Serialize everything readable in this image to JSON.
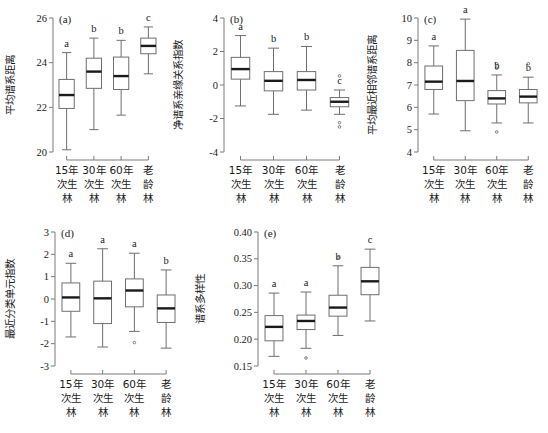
{
  "figure": {
    "title": "",
    "background": "#ffffff",
    "axis_color": "#7a7a7a",
    "box_color": "#6f6f6f",
    "median_color": "#1a1a1a",
    "text_color": "#1a1a1a"
  },
  "categories_label": [
    "15年次生林",
    "30年次生林",
    "60年次生林",
    "老龄林"
  ],
  "category_lines": [
    [
      "15年",
      "次生",
      "林"
    ],
    [
      "30年",
      "次生",
      "林"
    ],
    [
      "60年",
      "次生",
      "林"
    ],
    [
      "老",
      "龄",
      "林"
    ]
  ],
  "chart_data": [
    {
      "type": "box",
      "panel": "(a)",
      "title": "",
      "xlabel": "",
      "ylabel": "平均谱系距离",
      "ylim": [
        20,
        26
      ],
      "yticks": [
        20,
        22,
        24,
        26
      ],
      "ytick_labels": [
        "20",
        "22",
        "24",
        "26"
      ],
      "grid": false,
      "legend": "none",
      "categories": [
        "15年次生林",
        "30年次生林",
        "60年次生林",
        "老龄林"
      ],
      "sig_letters": [
        "a",
        "b",
        "b",
        "c"
      ],
      "boxes": [
        {
          "category": "15年次生林",
          "whisker_low": 20.1,
          "q1": 21.95,
          "median": 22.55,
          "q3": 23.25,
          "whisker_high": 24.45,
          "outliers": []
        },
        {
          "category": "30年次生林",
          "whisker_low": 21.0,
          "q1": 22.85,
          "median": 23.6,
          "q3": 24.2,
          "whisker_high": 25.1,
          "outliers": []
        },
        {
          "category": "60年次生林",
          "whisker_low": 21.65,
          "q1": 22.8,
          "median": 23.4,
          "q3": 24.25,
          "whisker_high": 25.0,
          "outliers": []
        },
        {
          "category": "老龄林",
          "whisker_low": 23.5,
          "q1": 24.4,
          "median": 24.75,
          "q3": 25.1,
          "whisker_high": 25.6,
          "outliers": []
        }
      ]
    },
    {
      "type": "box",
      "panel": "(b)",
      "title": "",
      "xlabel": "",
      "ylabel": "净谱系亲缘关系指数",
      "ylim": [
        -4,
        4
      ],
      "yticks": [
        -4,
        -2,
        0,
        2,
        4
      ],
      "ytick_labels": [
        "-4",
        "-2",
        "0",
        "2",
        "4"
      ],
      "grid": false,
      "legend": "none",
      "categories": [
        "15年次生林",
        "30年次生林",
        "60年次生林",
        "老龄林"
      ],
      "sig_letters": [
        "a",
        "b",
        "b",
        "c"
      ],
      "boxes": [
        {
          "category": "15年次生林",
          "whisker_low": -1.25,
          "q1": 0.35,
          "median": 0.95,
          "q3": 1.65,
          "whisker_high": 2.95,
          "outliers": []
        },
        {
          "category": "30年次生林",
          "whisker_low": -1.75,
          "q1": -0.35,
          "median": 0.25,
          "q3": 0.8,
          "whisker_high": 2.2,
          "outliers": []
        },
        {
          "category": "60年次生林",
          "whisker_low": -1.5,
          "q1": -0.3,
          "median": 0.3,
          "q3": 0.8,
          "whisker_high": 2.3,
          "outliers": []
        },
        {
          "category": "老龄林",
          "whisker_low": -1.75,
          "q1": -1.3,
          "median": -1.0,
          "q3": -0.75,
          "whisker_high": -0.3,
          "outliers": [
            0.55,
            -2.25,
            -2.5
          ]
        }
      ]
    },
    {
      "type": "box",
      "panel": "(c)",
      "title": "",
      "xlabel": "",
      "ylabel": "平均最近相邻谱系距离",
      "ylim": [
        4,
        10
      ],
      "yticks": [
        4,
        5,
        6,
        7,
        8,
        9,
        10
      ],
      "ytick_labels": [
        "4",
        "5",
        "6",
        "7",
        "8",
        "9",
        "10"
      ],
      "grid": false,
      "legend": "none",
      "categories": [
        "15年次生林",
        "30年次生林",
        "60年次生林",
        "老龄林"
      ],
      "sig_letters": [
        "a",
        "a",
        "b",
        "b"
      ],
      "boxes": [
        {
          "category": "15年次生林",
          "whisker_low": 5.7,
          "q1": 6.8,
          "median": 7.15,
          "q3": 7.85,
          "whisker_high": 8.75,
          "outliers": []
        },
        {
          "category": "30年次生林",
          "whisker_low": 4.95,
          "q1": 6.3,
          "median": 7.18,
          "q3": 8.55,
          "whisker_high": 9.95,
          "outliers": []
        },
        {
          "category": "60年次生林",
          "whisker_low": 5.3,
          "q1": 6.15,
          "median": 6.4,
          "q3": 6.75,
          "whisker_high": 7.45,
          "outliers": [
            7.95,
            7.75,
            4.9
          ]
        },
        {
          "category": "老龄林",
          "whisker_low": 5.3,
          "q1": 6.2,
          "median": 6.48,
          "q3": 6.8,
          "whisker_high": 7.35,
          "outliers": [
            7.95
          ]
        }
      ]
    },
    {
      "type": "box",
      "panel": "(d)",
      "title": "",
      "xlabel": "",
      "ylabel": "最近分类单元指数",
      "ylim": [
        -3,
        3
      ],
      "yticks": [
        -3,
        -2,
        -1,
        0,
        1,
        2,
        3
      ],
      "ytick_labels": [
        "-3",
        "-2",
        "-1",
        "0",
        "1",
        "2",
        "3"
      ],
      "grid": false,
      "legend": "none",
      "categories": [
        "15年次生林",
        "30年次生林",
        "60年次生林",
        "老龄林"
      ],
      "sig_letters": [
        "a",
        "a",
        "a",
        "b"
      ],
      "boxes": [
        {
          "category": "15年次生林",
          "whisker_low": -1.7,
          "q1": -0.55,
          "median": 0.07,
          "q3": 0.72,
          "whisker_high": 1.6,
          "outliers": []
        },
        {
          "category": "30年次生林",
          "whisker_low": -2.15,
          "q1": -1.1,
          "median": 0.03,
          "q3": 0.8,
          "whisker_high": 2.25,
          "outliers": []
        },
        {
          "category": "60年次生林",
          "whisker_low": -1.45,
          "q1": -0.35,
          "median": 0.38,
          "q3": 0.9,
          "whisker_high": 2.05,
          "outliers": [
            -1.95
          ]
        },
        {
          "category": "老龄林",
          "whisker_low": -2.2,
          "q1": -1.05,
          "median": -0.42,
          "q3": 0.18,
          "whisker_high": 1.3,
          "outliers": []
        }
      ]
    },
    {
      "type": "box",
      "panel": "(e)",
      "title": "",
      "xlabel": "",
      "ylabel": "谱系多样性",
      "ylim": [
        0.15,
        0.4
      ],
      "yticks": [
        0.15,
        0.2,
        0.25,
        0.3,
        0.35,
        0.4
      ],
      "ytick_labels": [
        "0.15",
        "0.20",
        "0.25",
        "0.30",
        "0.35",
        "0.40"
      ],
      "grid": false,
      "legend": "none",
      "categories": [
        "15年次生林",
        "30年次生林",
        "60年次生林",
        "老龄林"
      ],
      "sig_letters": [
        "a",
        "a",
        "b",
        "c"
      ],
      "boxes": [
        {
          "category": "15年次生林",
          "whisker_low": 0.168,
          "q1": 0.197,
          "median": 0.223,
          "q3": 0.244,
          "whisker_high": 0.286,
          "outliers": []
        },
        {
          "category": "30年次生林",
          "whisker_low": 0.183,
          "q1": 0.218,
          "median": 0.234,
          "q3": 0.245,
          "whisker_high": 0.288,
          "outliers": [
            0.165
          ]
        },
        {
          "category": "60年次生林",
          "whisker_low": 0.207,
          "q1": 0.243,
          "median": 0.259,
          "q3": 0.282,
          "whisker_high": 0.337,
          "outliers": [
            0.352
          ]
        },
        {
          "category": "老龄林",
          "whisker_low": 0.234,
          "q1": 0.283,
          "median": 0.308,
          "q3": 0.334,
          "whisker_high": 0.368,
          "outliers": []
        }
      ]
    }
  ]
}
